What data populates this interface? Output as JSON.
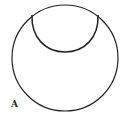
{
  "figure": {
    "panel_label": "A",
    "stroke_color": "#222222",
    "background": "#ffffff",
    "shapes": [
      {
        "name": "outer-circle",
        "type": "circle",
        "cx": 65,
        "cy": 58,
        "r": 53
      },
      {
        "name": "inner-arc",
        "type": "arc",
        "from": [
          32,
          15
        ],
        "to": [
          98,
          15
        ],
        "lowest_y": 52
      }
    ]
  }
}
